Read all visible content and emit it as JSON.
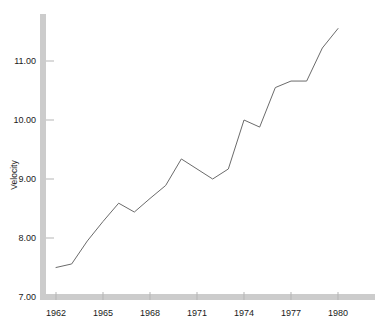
{
  "chart_data": {
    "type": "line",
    "title": "",
    "subtitle": "",
    "xlabel": "",
    "ylabel": "Velocity",
    "x": [
      1962,
      1963,
      1964,
      1965,
      1966,
      1967,
      1968,
      1969,
      1970,
      1971,
      1972,
      1973,
      1974,
      1975,
      1976,
      1977,
      1978,
      1979,
      1980
    ],
    "values": [
      7.5,
      7.56,
      7.95,
      8.28,
      8.59,
      8.44,
      8.67,
      8.89,
      9.34,
      9.17,
      9.0,
      9.17,
      10.0,
      9.88,
      10.55,
      10.66,
      10.66,
      11.22,
      11.55
    ],
    "series": [
      {
        "name": "Velocity",
        "values": [
          7.5,
          7.56,
          7.95,
          8.28,
          8.59,
          8.44,
          8.67,
          8.89,
          9.34,
          9.17,
          9.0,
          9.17,
          10.0,
          9.88,
          10.55,
          10.66,
          10.66,
          11.22,
          11.55
        ]
      }
    ],
    "xlim": [
      1962,
      1980
    ],
    "ylim": [
      7.0,
      11.55
    ],
    "xticks": [
      1962,
      1965,
      1968,
      1971,
      1974,
      1977,
      1980
    ],
    "xtick_labels": [
      "1962",
      "1965",
      "1968",
      "1971",
      "1974",
      "1977",
      "1980"
    ],
    "yticks": [
      7.0,
      8.0,
      9.0,
      10.0,
      11.0
    ],
    "ytick_labels": [
      "7.00",
      "8.00",
      "9.00",
      "10.00",
      "11.00"
    ],
    "grid": false,
    "legend": null,
    "line_color": "#6b6b6b",
    "axis_color": "#cccccc",
    "background_color": "#ffffff"
  },
  "axes": {
    "y_title": "Velocity"
  }
}
